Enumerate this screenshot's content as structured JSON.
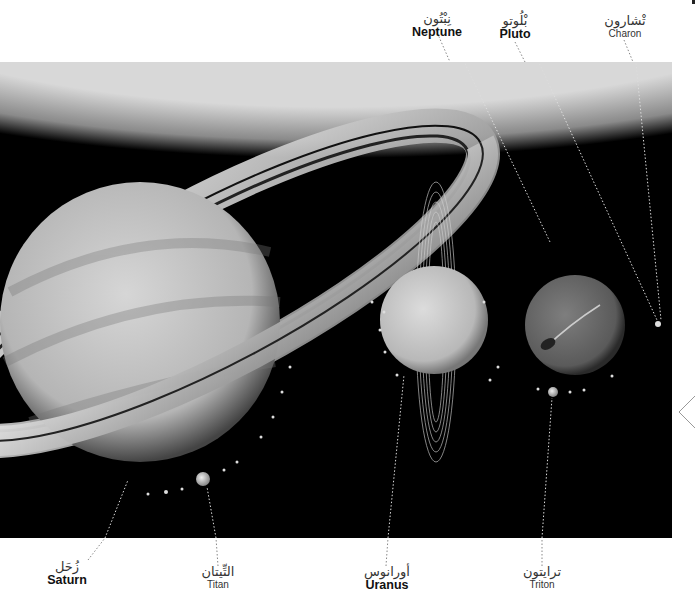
{
  "labels": {
    "neptune": {
      "arabic": "نِبْتُون",
      "english": "Neptune"
    },
    "pluto": {
      "arabic": "بْلُوتو",
      "english": "Pluto"
    },
    "charon": {
      "arabic": "تْشارون",
      "english": "Charon"
    },
    "saturn": {
      "arabic": "زُحَل",
      "english": "Saturn"
    },
    "titan": {
      "arabic": "التِّيتان",
      "english": "Titan"
    },
    "uranus": {
      "arabic": "أورانوس",
      "english": "Uranus"
    },
    "triton": {
      "arabic": "ترايتون",
      "english": "Triton"
    }
  },
  "icons": {
    "nav": "chevron-left-icon"
  },
  "colors": {
    "background": "#000000",
    "page": "#ffffff",
    "leader": "#dddddd"
  }
}
